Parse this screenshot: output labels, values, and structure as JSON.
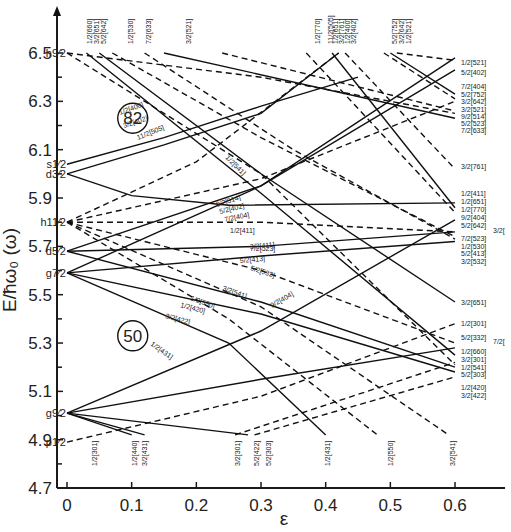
{
  "chart_data": {
    "type": "line",
    "title": "",
    "xlabel": "ε",
    "ylabel": "E/ħω₀ (ω)",
    "xlim": [
      -0.03,
      0.65
    ],
    "ylim": [
      4.7,
      6.6
    ],
    "x_ticks": [
      "0",
      "0.1",
      "0.2",
      "0.3",
      "0.4",
      "0.5",
      "0.6"
    ],
    "y_ticks": [
      "4.7",
      "4.9",
      "5.1",
      "5.3",
      "5.5",
      "5.7",
      "5.9",
      "6.1",
      "6.3",
      "6.5"
    ],
    "grid": false,
    "magic_numbers": [
      {
        "label": "82",
        "x": 0.08,
        "y": 6.23
      },
      {
        "label": "50",
        "x": 0.08,
        "y": 5.33
      }
    ],
    "spherical_shells": [
      {
        "label": "h9/2",
        "energy": 6.5
      },
      {
        "label": "s1/2",
        "energy": 6.04
      },
      {
        "label": "d3/2",
        "energy": 6.0
      },
      {
        "label": "h11/2",
        "energy": 5.8
      },
      {
        "label": "d5/2",
        "energy": 5.68
      },
      {
        "label": "g7/2",
        "energy": 5.59
      },
      {
        "label": "g9/2",
        "energy": 5.01
      },
      {
        "label": "p1/2",
        "energy": 4.89
      }
    ],
    "series": [
      {
        "name": "1/2[400]",
        "style": "solid",
        "points": [
          [
            0,
            6.04
          ],
          [
            0.15,
            6.15
          ],
          [
            0.3,
            6.28
          ],
          [
            0.45,
            6.4
          ]
        ]
      },
      {
        "name": "3/2[402]",
        "style": "solid",
        "points": [
          [
            0,
            6.0
          ],
          [
            0.15,
            6.12
          ],
          [
            0.3,
            6.25
          ],
          [
            0.42,
            6.5
          ]
        ]
      },
      {
        "name": "1/2[411]",
        "style": "solid",
        "points": [
          [
            0,
            6.0
          ],
          [
            0.1,
            5.91
          ],
          [
            0.25,
            5.87
          ],
          [
            0.6,
            5.88
          ]
        ]
      },
      {
        "name": "11/2[505]",
        "style": "dash",
        "points": [
          [
            0,
            5.8
          ],
          [
            0.2,
            6.05
          ],
          [
            0.42,
            6.5
          ]
        ]
      },
      {
        "name": "9/2[514]",
        "style": "dash",
        "points": [
          [
            0,
            5.8
          ],
          [
            0.3,
            5.98
          ],
          [
            0.6,
            6.3
          ]
        ]
      },
      {
        "name": "7/2[523]",
        "style": "dash",
        "points": [
          [
            0,
            5.8
          ],
          [
            0.3,
            5.8
          ],
          [
            0.6,
            5.76
          ]
        ]
      },
      {
        "name": "5/2[532]",
        "style": "dash",
        "points": [
          [
            0,
            5.8
          ],
          [
            0.3,
            5.6
          ],
          [
            0.6,
            5.3
          ]
        ]
      },
      {
        "name": "3/2[541]",
        "style": "dash",
        "points": [
          [
            0,
            5.8
          ],
          [
            0.3,
            5.45
          ],
          [
            0.59,
            4.92
          ]
        ]
      },
      {
        "name": "1/2[550]",
        "style": "dash",
        "points": [
          [
            0,
            5.8
          ],
          [
            0.25,
            5.4
          ],
          [
            0.48,
            4.92
          ]
        ]
      },
      {
        "name": "5/2[402]",
        "style": "solid",
        "points": [
          [
            0,
            5.68
          ],
          [
            0.3,
            5.95
          ],
          [
            0.6,
            6.48
          ]
        ]
      },
      {
        "name": "3/2[411]",
        "style": "solid",
        "points": [
          [
            0,
            5.68
          ],
          [
            0.3,
            5.7
          ],
          [
            0.6,
            5.76
          ]
        ]
      },
      {
        "name": "1/2[420]",
        "style": "solid",
        "points": [
          [
            0,
            5.68
          ],
          [
            0.3,
            5.47
          ],
          [
            0.6,
            5.2
          ]
        ]
      },
      {
        "name": "7/2[404]",
        "style": "solid",
        "points": [
          [
            0,
            5.59
          ],
          [
            0.3,
            5.95
          ],
          [
            0.6,
            6.43
          ]
        ]
      },
      {
        "name": "5/2[413]",
        "style": "solid",
        "points": [
          [
            0,
            5.59
          ],
          [
            0.3,
            5.66
          ],
          [
            0.6,
            5.72
          ]
        ]
      },
      {
        "name": "3/2[422]",
        "style": "solid",
        "points": [
          [
            0,
            5.59
          ],
          [
            0.3,
            5.42
          ],
          [
            0.6,
            5.18
          ]
        ]
      },
      {
        "name": "1/2[431]",
        "style": "solid",
        "points": [
          [
            0,
            5.59
          ],
          [
            0.25,
            5.3
          ],
          [
            0.4,
            4.92
          ]
        ]
      },
      {
        "name": "9/2[404]",
        "style": "solid",
        "points": [
          [
            0,
            5.01
          ],
          [
            0.3,
            5.35
          ],
          [
            0.6,
            5.81
          ]
        ]
      },
      {
        "name": "7/2[413]",
        "style": "solid",
        "points": [
          [
            0,
            5.01
          ],
          [
            0.3,
            5.15
          ],
          [
            0.6,
            5.28
          ]
        ]
      },
      {
        "name": "1/2[440]",
        "style": "solid",
        "points": [
          [
            0,
            5.01
          ],
          [
            0.1,
            4.92
          ]
        ]
      },
      {
        "name": "3/2[431]",
        "style": "solid",
        "points": [
          [
            0,
            5.01
          ],
          [
            0.12,
            4.92
          ]
        ]
      },
      {
        "name": "5/2[422]",
        "style": "solid",
        "points": [
          [
            0,
            5.01
          ],
          [
            0.28,
            4.92
          ]
        ]
      },
      {
        "name": "1/2[301]",
        "style": "dash",
        "points": [
          [
            0,
            4.89
          ],
          [
            0.3,
            5.08
          ],
          [
            0.6,
            5.38
          ]
        ]
      },
      {
        "name": "3/2[301]",
        "style": "dash",
        "points": [
          [
            0.26,
            4.92
          ],
          [
            0.6,
            5.22
          ]
        ]
      },
      {
        "name": "5/2[303]",
        "style": "dash",
        "points": [
          [
            0.29,
            4.92
          ],
          [
            0.6,
            5.16
          ]
        ]
      },
      {
        "name": "1/2[660]",
        "style": "solid",
        "points": [
          [
            0.03,
            6.5
          ],
          [
            0.3,
            5.92
          ],
          [
            0.6,
            5.25
          ]
        ]
      },
      {
        "name": "3/2[651]",
        "style": "solid",
        "points": [
          [
            0.05,
            6.5
          ],
          [
            0.3,
            6.0
          ],
          [
            0.6,
            5.47
          ]
        ]
      },
      {
        "name": "5/2[642]",
        "style": "dash",
        "points": [
          [
            0.07,
            6.5
          ],
          [
            0.3,
            6.15
          ],
          [
            0.6,
            5.74
          ]
        ]
      },
      {
        "name": "1/2[530]",
        "style": "dash",
        "points": [
          [
            0.12,
            6.5
          ],
          [
            0.35,
            6.1
          ],
          [
            0.6,
            5.73
          ]
        ]
      },
      {
        "name": "7/2[633]",
        "style": "solid",
        "points": [
          [
            0.15,
            6.5
          ],
          [
            0.6,
            6.23
          ]
        ]
      },
      {
        "name": "3/2[521]",
        "style": "dash",
        "points": [
          [
            0.24,
            6.5
          ],
          [
            0.6,
            6.26
          ]
        ]
      },
      {
        "name": "1/2[770]",
        "style": "dash",
        "points": [
          [
            0.37,
            6.5
          ],
          [
            0.6,
            5.84
          ]
        ]
      },
      {
        "name": "1/2[651]",
        "style": "solid",
        "points": [
          [
            0.41,
            6.5
          ],
          [
            0.6,
            5.86
          ]
        ]
      },
      {
        "name": "3/2[761]",
        "style": "dash",
        "points": [
          [
            0.43,
            6.5
          ],
          [
            0.6,
            6.02
          ]
        ]
      },
      {
        "name": "5/2[752]",
        "style": "dash",
        "points": [
          [
            0.49,
            6.5
          ],
          [
            0.6,
            6.31
          ]
        ]
      },
      {
        "name": "3/2[642]",
        "style": "solid",
        "points": [
          [
            0.5,
            6.5
          ],
          [
            0.6,
            6.33
          ]
        ]
      },
      {
        "name": "1/2[521]",
        "style": "dash",
        "points": [
          [
            0.51,
            6.5
          ],
          [
            0.6,
            6.47
          ]
        ]
      },
      {
        "name": "5/2[523]",
        "style": "dash",
        "points": [
          [
            0,
            6.5
          ],
          [
            0.3,
            6.4
          ],
          [
            0.6,
            6.25
          ]
        ]
      },
      {
        "name": "1/2[541]",
        "style": "dash",
        "points": [
          [
            0,
            6.5
          ],
          [
            0.3,
            6.0
          ],
          [
            0.6,
            5.21
          ]
        ]
      }
    ],
    "top_labels": [
      "1/2[660]",
      "3/2[651]",
      "5/2[642]",
      "1/2[530]",
      "7/2[633]",
      "3/2[521]",
      "1/2[770]",
      "11/2[505]",
      "1/2[651]",
      "3/2[761]",
      "1/2[400]",
      "3/2[402]",
      "5/2[752]",
      "3/2[642]",
      "1/2[521]"
    ],
    "right_labels": [
      "1/2[521]",
      "5/2[402]",
      "7/2[404]",
      "5/2[752]",
      "3/2[642]",
      "3/2[521]",
      "9/2[514]",
      "5/2[523]",
      "7/2[633]",
      "3/2[761]",
      "1/2[411]",
      "1/2[651]",
      "1/2[770]",
      "9/2[404]",
      "5/2[642]",
      "3/2[",
      "7/2[523]",
      "1/2[530]",
      "5/2[413]",
      "3/2[532]",
      "3/2[651]",
      "1/2[301]",
      "5/2[332]",
      "7/2[",
      "1/2[660]",
      "3/2[301]",
      "1/2[541]",
      "5/2[303]",
      "1/2[420]",
      "3/2[422]"
    ],
    "bottom_labels": [
      "1/2[301]",
      "1/2[440]",
      "3/2[431]",
      "3/2[301]",
      "5/2[422]",
      "5/2[303]",
      "1/2[431]",
      "1/2[550]",
      "3/2[541]"
    ],
    "inline_labels": [
      "1/2[400]",
      "3/2[402]",
      "11/2[505]",
      "1/2[541]",
      "9/2[514]",
      "5/2[402]",
      "7/2[404]",
      "1/2[411]",
      "7/2[523]",
      "3/2[411]",
      "5/2[413]",
      "5/2[532]",
      "3/2[541]",
      "1/2[550]",
      "1/2[420]",
      "3/2[422]",
      "1/2[431]",
      "9/2[404]"
    ]
  }
}
